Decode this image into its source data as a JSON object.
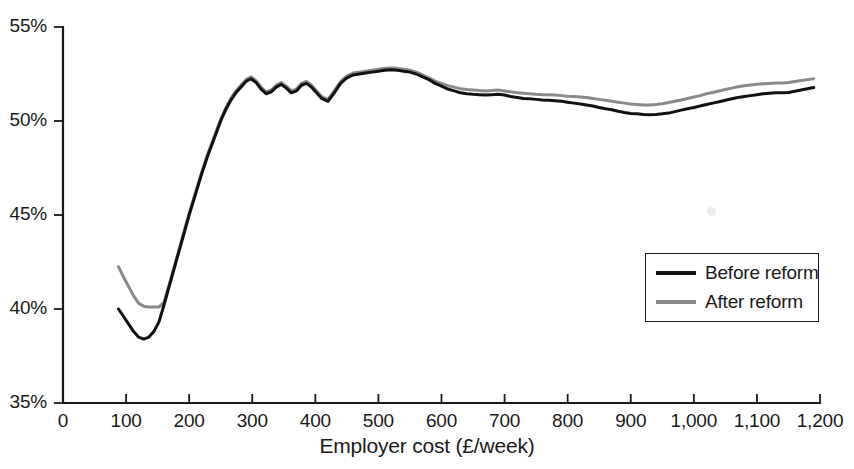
{
  "chart_data": {
    "type": "line",
    "title": "",
    "xlabel": "Employer cost (£/week)",
    "ylabel": "",
    "xlim": [
      0,
      1200
    ],
    "ylim": [
      35,
      55
    ],
    "grid": false,
    "legend_position": "middle-right",
    "x_ticks": [
      0,
      100,
      200,
      300,
      400,
      500,
      600,
      700,
      800,
      900,
      1000,
      1100,
      1200
    ],
    "x_tick_labels": [
      "0",
      "100",
      "200",
      "300",
      "400",
      "500",
      "600",
      "700",
      "800",
      "900",
      "1,000",
      "1,100",
      "1,200"
    ],
    "y_ticks": [
      35,
      40,
      45,
      50,
      55
    ],
    "y_tick_labels": [
      "35%",
      "40%",
      "45%",
      "50%",
      "55%"
    ],
    "series": [
      {
        "name": "Before reform",
        "color": "#111111",
        "x": [
          88,
          96,
          104,
          112,
          120,
          128,
          136,
          144,
          152,
          160,
          170,
          180,
          190,
          200,
          210,
          220,
          230,
          240,
          250,
          258,
          266,
          274,
          282,
          290,
          298,
          306,
          314,
          322,
          330,
          338,
          346,
          354,
          362,
          370,
          378,
          386,
          394,
          402,
          410,
          420,
          430,
          440,
          450,
          460,
          470,
          480,
          490,
          500,
          510,
          520,
          530,
          540,
          550,
          560,
          570,
          580,
          590,
          600,
          610,
          620,
          630,
          640,
          650,
          660,
          670,
          680,
          690,
          700,
          710,
          720,
          730,
          740,
          750,
          760,
          770,
          780,
          790,
          800,
          810,
          820,
          830,
          840,
          850,
          860,
          870,
          880,
          890,
          900,
          910,
          920,
          930,
          940,
          950,
          960,
          970,
          980,
          990,
          1000,
          1010,
          1020,
          1030,
          1040,
          1050,
          1060,
          1070,
          1080,
          1090,
          1100,
          1110,
          1120,
          1130,
          1140,
          1150,
          1160,
          1170,
          1180,
          1190
        ],
        "y": [
          40.0,
          39.6,
          39.2,
          38.8,
          38.5,
          38.4,
          38.5,
          38.8,
          39.3,
          40.2,
          41.4,
          42.6,
          43.8,
          45.0,
          46.1,
          47.2,
          48.2,
          49.1,
          50.0,
          50.6,
          51.1,
          51.5,
          51.8,
          52.1,
          52.25,
          52.05,
          51.7,
          51.45,
          51.55,
          51.8,
          51.95,
          51.75,
          51.5,
          51.6,
          51.9,
          52.0,
          51.8,
          51.5,
          51.2,
          51.05,
          51.5,
          52.0,
          52.3,
          52.45,
          52.5,
          52.55,
          52.6,
          52.65,
          52.7,
          52.72,
          52.7,
          52.65,
          52.6,
          52.5,
          52.35,
          52.2,
          52.0,
          51.85,
          51.7,
          51.6,
          51.5,
          51.45,
          51.42,
          51.4,
          51.38,
          51.4,
          51.42,
          51.38,
          51.3,
          51.25,
          51.2,
          51.18,
          51.15,
          51.12,
          51.1,
          51.08,
          51.05,
          51.0,
          50.95,
          50.9,
          50.85,
          50.8,
          50.72,
          50.65,
          50.6,
          50.52,
          50.45,
          50.4,
          50.38,
          50.35,
          50.33,
          50.35,
          50.38,
          50.42,
          50.5,
          50.58,
          50.65,
          50.72,
          50.8,
          50.88,
          50.95,
          51.02,
          51.1,
          51.18,
          51.25,
          51.3,
          51.35,
          51.4,
          51.45,
          51.48,
          51.5,
          51.5,
          51.52,
          51.58,
          51.65,
          51.72,
          51.78
        ]
      },
      {
        "name": "After reform",
        "color": "#8a8a8a",
        "x": [
          88,
          96,
          104,
          112,
          120,
          128,
          136,
          144,
          152,
          160,
          170,
          180,
          190,
          200,
          210,
          220,
          230,
          240,
          250,
          258,
          266,
          274,
          282,
          290,
          298,
          306,
          314,
          322,
          330,
          338,
          346,
          354,
          362,
          370,
          378,
          386,
          394,
          402,
          410,
          420,
          430,
          440,
          450,
          460,
          470,
          480,
          490,
          500,
          510,
          520,
          530,
          540,
          550,
          560,
          570,
          580,
          590,
          600,
          610,
          620,
          630,
          640,
          650,
          660,
          670,
          680,
          690,
          700,
          710,
          720,
          730,
          740,
          750,
          760,
          770,
          780,
          790,
          800,
          810,
          820,
          830,
          840,
          850,
          860,
          870,
          880,
          890,
          900,
          910,
          920,
          930,
          940,
          950,
          960,
          970,
          980,
          990,
          1000,
          1010,
          1020,
          1030,
          1040,
          1050,
          1060,
          1070,
          1080,
          1090,
          1100,
          1110,
          1120,
          1130,
          1140,
          1150,
          1160,
          1170,
          1180,
          1190
        ],
        "y": [
          42.25,
          41.7,
          41.2,
          40.7,
          40.3,
          40.15,
          40.1,
          40.1,
          40.1,
          40.35,
          41.5,
          42.7,
          43.9,
          45.1,
          46.2,
          47.3,
          48.3,
          49.2,
          50.1,
          50.7,
          51.2,
          51.6,
          51.9,
          52.2,
          52.35,
          52.15,
          51.8,
          51.55,
          51.65,
          51.9,
          52.05,
          51.85,
          51.6,
          51.7,
          52.0,
          52.1,
          51.9,
          51.6,
          51.3,
          51.15,
          51.6,
          52.1,
          52.4,
          52.55,
          52.6,
          52.65,
          52.7,
          52.75,
          52.8,
          52.82,
          52.8,
          52.75,
          52.7,
          52.6,
          52.45,
          52.3,
          52.12,
          52.0,
          51.88,
          51.8,
          51.72,
          51.68,
          51.65,
          51.62,
          51.6,
          51.62,
          51.65,
          51.6,
          51.55,
          51.5,
          51.48,
          51.45,
          51.42,
          51.4,
          51.4,
          51.38,
          51.35,
          51.32,
          51.3,
          51.28,
          51.25,
          51.2,
          51.15,
          51.1,
          51.05,
          51.0,
          50.95,
          50.9,
          50.88,
          50.85,
          50.85,
          50.88,
          50.92,
          50.98,
          51.05,
          51.12,
          51.2,
          51.28,
          51.35,
          51.45,
          51.52,
          51.6,
          51.68,
          51.75,
          51.82,
          51.88,
          51.92,
          51.95,
          51.98,
          52.0,
          52.02,
          52.02,
          52.05,
          52.1,
          52.15,
          52.2,
          52.25
        ]
      }
    ]
  },
  "legend": {
    "entries": [
      {
        "label": "Before reform"
      },
      {
        "label": "After reform"
      }
    ]
  },
  "icons": {
    "legend_swatch_before": "line-swatch-black-icon",
    "legend_swatch_after": "line-swatch-gray-icon"
  }
}
